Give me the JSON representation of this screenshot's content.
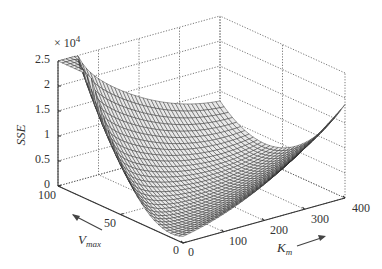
{
  "chart_data": {
    "type": "surface3d",
    "title": "",
    "xlabel": "K_m",
    "ylabel": "V_max",
    "zlabel": "SSE",
    "z_multiplier": "× 10^4",
    "xlim": [
      0,
      400
    ],
    "ylim": [
      0,
      100
    ],
    "zlim": [
      0,
      2.5
    ],
    "x_ticks": [
      0,
      100,
      200,
      300,
      400
    ],
    "y_ticks": [
      0,
      50,
      100
    ],
    "z_ticks": [
      0,
      0.5,
      1,
      1.5,
      2,
      2.5
    ],
    "grid": true,
    "grid_style": "dotted",
    "surface_color": "#333333",
    "surface_samples": {
      "description": "Approximate SSE (×10^4) values read from the mesh; minimum valley near low Km, mid Vmax",
      "corner_Km0_Vmax100": 2.45,
      "corner_Km400_Vmax100": 1.4,
      "corner_Km400_Vmax0": 0.35,
      "corner_Km0_Vmax0": 0.3,
      "valley_min": 0.05
    }
  },
  "labels": {
    "z_multiplier": "× 10",
    "z_exponent": "4",
    "z_axis": "SSE",
    "x_axis_main": "K",
    "x_axis_sub": "m",
    "y_axis_main": "V",
    "y_axis_sub": "max"
  },
  "ticks": {
    "z": [
      "0",
      "0.5",
      "1",
      "1.5",
      "2",
      "2.5"
    ],
    "x": [
      "0",
      "100",
      "200",
      "300",
      "400"
    ],
    "y": [
      "0",
      "50",
      "100"
    ]
  }
}
